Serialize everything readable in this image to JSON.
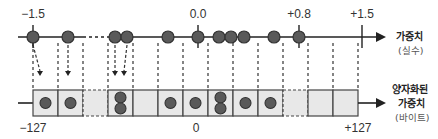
{
  "diagram": {
    "top_axis": {
      "label": "가중치",
      "sublabel": "(실수)",
      "ticks": [
        {
          "x": 33,
          "label": "−1.5"
        },
        {
          "x": 198,
          "label": "0.0"
        },
        {
          "x": 299,
          "label": "+0.8"
        },
        {
          "x": 362,
          "label": "+1.5"
        }
      ],
      "dots_x": [
        33,
        68,
        115,
        127,
        168,
        198,
        219,
        231,
        244,
        274,
        299
      ]
    },
    "bottom_axis": {
      "label_line1": "양자화된",
      "label_line2": "가중치",
      "sublabel": "(바이트)",
      "ticks": [
        {
          "x": 33,
          "label": "−127"
        },
        {
          "x": 196,
          "label": "0"
        },
        {
          "x": 358,
          "label": "+127"
        }
      ]
    },
    "columns_x": [
      33,
      58,
      83,
      108,
      133,
      158,
      183,
      208,
      233,
      258,
      283,
      308,
      333,
      358
    ],
    "cells": [
      {
        "x": 33,
        "dots": 1,
        "dashed": false
      },
      {
        "x": 58,
        "dots": 1,
        "dashed": false
      },
      {
        "x": 83,
        "dots": 0,
        "dashed": true
      },
      {
        "x": 108,
        "dots": 2,
        "dashed": false
      },
      {
        "x": 133,
        "dots": 0,
        "dashed": false
      },
      {
        "x": 158,
        "dots": 1,
        "dashed": false
      },
      {
        "x": 183,
        "dots": 1,
        "dashed": false
      },
      {
        "x": 208,
        "dots": 2,
        "dashed": false
      },
      {
        "x": 233,
        "dots": 1,
        "dashed": false
      },
      {
        "x": 258,
        "dots": 1,
        "dashed": false
      },
      {
        "x": 283,
        "dots": 0,
        "dashed": true
      },
      {
        "x": 308,
        "dots": 0,
        "dashed": false
      },
      {
        "x": 333,
        "dots": 0,
        "dashed": false
      }
    ],
    "mapping_arrows": [
      {
        "from_x": 33,
        "to_x": 40
      },
      {
        "from_x": 68,
        "to_x": 68
      },
      {
        "from_x": 115,
        "to_x": 115
      },
      {
        "from_x": 127,
        "to_x": 124
      }
    ],
    "colors": {
      "dot": "#5a5a5a",
      "dot_stroke": "#333333",
      "cell_fill": "#e8e8e8",
      "line": "#222222"
    }
  }
}
